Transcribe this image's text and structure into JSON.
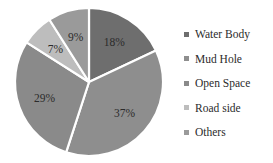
{
  "chart_data": {
    "type": "pie",
    "title": "",
    "labels": [
      "Water Body",
      "Mud Hole",
      "Open Space",
      "Road side",
      "Others"
    ],
    "values": [
      18,
      37,
      29,
      7,
      9
    ],
    "value_labels": [
      "18%",
      "37%",
      "29%",
      "7%",
      "9%"
    ],
    "colors": [
      "#6e6e6e",
      "#8e8e8e",
      "#8a8a8a",
      "#bdbdbd",
      "#9a9a9a"
    ],
    "start_angle_deg": 0,
    "direction": "clockwise",
    "separator_color": "#ffffff",
    "legend_position": "right",
    "legend_marker_shape": "square",
    "grid": false,
    "xlabel": "",
    "ylabel": ""
  },
  "legend": {
    "items": [
      {
        "label": "Water Body",
        "color": "#6e6e6e"
      },
      {
        "label": "Mud Hole",
        "color": "#8e8e8e"
      },
      {
        "label": "Open Space",
        "color": "#8a8a8a"
      },
      {
        "label": "Road side",
        "color": "#bdbdbd"
      },
      {
        "label": "Others",
        "color": "#9a9a9a"
      }
    ]
  }
}
